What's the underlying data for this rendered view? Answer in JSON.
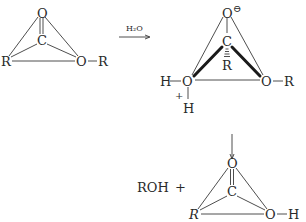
{
  "reactant": {
    "atoms": {
      "o_top": "O",
      "c": "C",
      "r_left": "R",
      "o_right": "O",
      "r_sub": "R"
    },
    "bond_dash": "—"
  },
  "reaction_arrow": {
    "reagent": "H₂O"
  },
  "intermediate": {
    "atoms": {
      "o_top": "O",
      "o_charge": "⊖",
      "c": "C",
      "r_below": "R",
      "o_left": "O",
      "h_left": "H",
      "h_below": "H",
      "plus_charge": "+",
      "o_right": "O",
      "r_sub": "R"
    }
  },
  "product": {
    "byproduct": "ROH",
    "plus": "+",
    "atoms": {
      "o_top": "O",
      "c": "C",
      "r_left": "R",
      "o_right": "O",
      "h_sub": "H"
    }
  },
  "colors": {
    "ink": "#2a2a2a",
    "background": "#ffffff"
  }
}
